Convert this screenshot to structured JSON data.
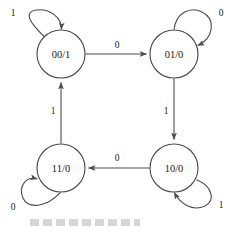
{
  "diagram": {
    "type": "state-transition-diagram",
    "title": "",
    "states": [
      {
        "id": "s00",
        "label": "00/1",
        "cx": 61,
        "cy": 54,
        "r": 24,
        "position": "top-left"
      },
      {
        "id": "s01",
        "label": "01/0",
        "cx": 174,
        "cy": 54,
        "r": 24,
        "position": "top-right"
      },
      {
        "id": "s11",
        "label": "11/0",
        "cx": 61,
        "cy": 168,
        "r": 24,
        "position": "bottom-left"
      },
      {
        "id": "s10",
        "label": "10/0",
        "cx": 174,
        "cy": 168,
        "r": 24,
        "position": "bottom-right"
      }
    ],
    "transitions": [
      {
        "from": "s00",
        "to": "s01",
        "label": "0",
        "label_x": 117,
        "label_y": 45,
        "direction": "right"
      },
      {
        "from": "s01",
        "to": "s10",
        "label": "1",
        "label_x": 166,
        "label_y": 111,
        "direction": "down"
      },
      {
        "from": "s10",
        "to": "s11",
        "label": "0",
        "label_x": 117,
        "label_y": 158,
        "direction": "left"
      },
      {
        "from": "s11",
        "to": "s00",
        "label": "1",
        "label_x": 53,
        "label_y": 111,
        "direction": "up"
      }
    ],
    "self_loops": [
      {
        "state": "s00",
        "label": "1",
        "label_x": 13,
        "label_y": 13,
        "orientation": "up-left"
      },
      {
        "state": "s01",
        "label": "0",
        "label_x": 221,
        "label_y": 13,
        "orientation": "up-right"
      },
      {
        "state": "s11",
        "label": "0",
        "label_x": 13,
        "label_y": 207,
        "orientation": "down-left"
      },
      {
        "state": "s10",
        "label": "1",
        "label_x": 221,
        "label_y": 205,
        "orientation": "down-right"
      }
    ],
    "colors": {
      "stroke": "#4d4d4d",
      "text": "#1a1a1a",
      "background": "#ffffff"
    }
  }
}
